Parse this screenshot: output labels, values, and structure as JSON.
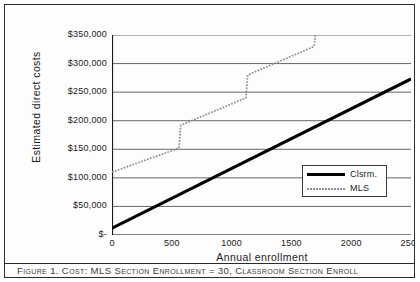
{
  "figure": {
    "caption": "Figure 1. Cost: MLS Section Enrollment = 30, Classroom Section Enroll"
  },
  "chart_data": {
    "type": "line",
    "title": "",
    "xlabel": "Annual enrollment",
    "ylabel": "Estimated direct costs",
    "xlim": [
      0,
      2500
    ],
    "ylim": [
      0,
      350000
    ],
    "xticks": [
      0,
      500,
      1000,
      1500,
      2000,
      2500
    ],
    "xticklabels": [
      "0",
      "500",
      "1000",
      "1500",
      "2000",
      "2500"
    ],
    "yticks": [
      0,
      50000,
      100000,
      150000,
      200000,
      250000,
      300000,
      350000
    ],
    "yticklabels": [
      "$-",
      "$50,000",
      "$100,000",
      "$150,000",
      "$200,000",
      "$250,000",
      "$300,000",
      "$350,000"
    ],
    "grid": "horizontal",
    "legend_position": "center-right",
    "series": [
      {
        "name": "Clsrm.",
        "style": "solid-thick",
        "color": "#000000",
        "points": [
          [
            0,
            12000
          ],
          [
            2500,
            273000
          ]
        ]
      },
      {
        "name": "MLS",
        "style": "dotted",
        "color": "#8e8e8e",
        "points": [
          [
            0,
            110000
          ],
          [
            560,
            152000
          ],
          [
            575,
            192000
          ],
          [
            1120,
            240000
          ],
          [
            1135,
            280000
          ],
          [
            1690,
            330000
          ],
          [
            1700,
            350000
          ]
        ]
      }
    ]
  },
  "legend": {
    "entries": [
      {
        "label": "Clsrm."
      },
      {
        "label": "MLS"
      }
    ]
  }
}
